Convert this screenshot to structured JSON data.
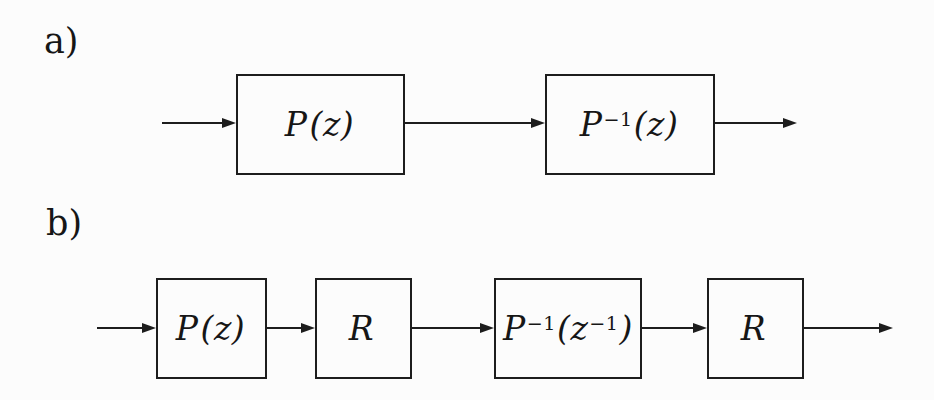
{
  "figure": {
    "background": "#fcfcfc",
    "ink": "#1d1d1d",
    "text_color": "#161616"
  },
  "diagram_a": {
    "label": "a)",
    "blocks": [
      {
        "label": "P(z)",
        "pre": "P",
        "mid": "(z)"
      },
      {
        "label": "P⁻¹(z)",
        "pre": "P",
        "sup": "−1",
        "mid": "(z)"
      }
    ]
  },
  "diagram_b": {
    "label": "b)",
    "blocks": [
      {
        "label": "P(z)",
        "pre": "P",
        "mid": "(z)"
      },
      {
        "label": "R",
        "pre": "R"
      },
      {
        "label": "P⁻¹(z⁻¹)",
        "pre": "P",
        "sup": "−1",
        "mid": "(z",
        "sup2": "−1",
        "post": ")"
      },
      {
        "label": "R",
        "pre": "R"
      }
    ]
  }
}
